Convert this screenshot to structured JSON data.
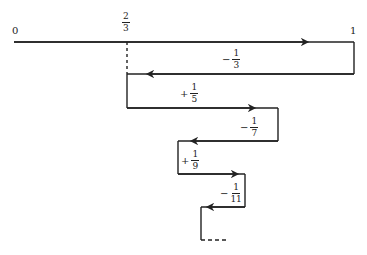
{
  "diagram": {
    "type": "alternating-series-number-line",
    "labels": {
      "zero": "0",
      "one": "1",
      "two_thirds": {
        "num": "2",
        "den": "3"
      }
    },
    "terms": [
      {
        "sign": "−",
        "num": "1",
        "den": "3"
      },
      {
        "sign": "+",
        "num": "1",
        "den": "5"
      },
      {
        "sign": "−",
        "num": "1",
        "den": "7"
      },
      {
        "sign": "+",
        "num": "1",
        "den": "9"
      },
      {
        "sign": "−",
        "num": "1",
        "den": "11"
      }
    ],
    "line_color": "#222222"
  }
}
